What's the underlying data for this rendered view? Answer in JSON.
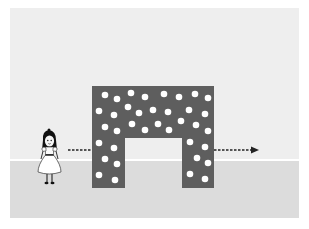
{
  "scene": {
    "caption_fragment": "",
    "description": "Girl standing left of a dotted gray arch-shaped block with a dashed arrow passing through the arch opening",
    "colors": {
      "background": "#ffffff",
      "sky": "#eeeeee",
      "ground": "#dcdcdc",
      "block": "#5e5e5e",
      "dots": "#ffffff",
      "arrow": "#222222"
    },
    "block": {
      "x": 92,
      "y": 86,
      "width": 122,
      "height": 102,
      "opening": {
        "x": 125,
        "y": 138,
        "width": 57,
        "height": 50
      }
    },
    "arrow": {
      "from_x": 68,
      "to_x": 258,
      "y": 150
    },
    "girl": {
      "x": 37,
      "y": 130
    }
  }
}
